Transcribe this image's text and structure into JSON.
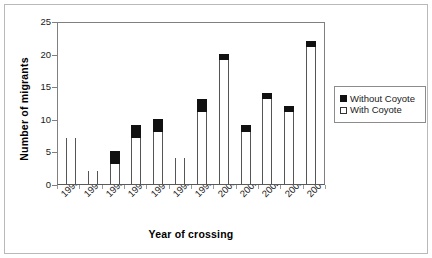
{
  "chart_data": {
    "type": "bar",
    "stacked": true,
    "title": "",
    "xlabel": "Year of crossing",
    "ylabel": "Number of migrants",
    "categories": [
      "1993",
      "1994",
      "1995",
      "1996",
      "1997",
      "1998",
      "1999",
      "2000",
      "2001",
      "2002",
      "2003",
      "2004"
    ],
    "series": [
      {
        "name": "With Coyote",
        "color": "#ffffff",
        "values": [
          7,
          2,
          3,
          7,
          8,
          4,
          11,
          19,
          8,
          13,
          11,
          21
        ]
      },
      {
        "name": "Without Coyote",
        "color": "#111111",
        "values": [
          0,
          0,
          2,
          2,
          2,
          0,
          2,
          1,
          1,
          1,
          1,
          1
        ]
      }
    ],
    "totals": [
      7,
      2,
      5,
      9,
      10,
      4,
      13,
      20,
      9,
      14,
      12,
      22
    ],
    "ylim": [
      0,
      25
    ],
    "yticks": [
      0,
      5,
      10,
      15,
      20,
      25
    ],
    "ytick_labels": [
      "0",
      "5",
      "10",
      "15",
      "20",
      "25"
    ],
    "grid": false,
    "legend_position": "right",
    "legend_entries": [
      "Without Coyote",
      "With Coyote"
    ]
  }
}
